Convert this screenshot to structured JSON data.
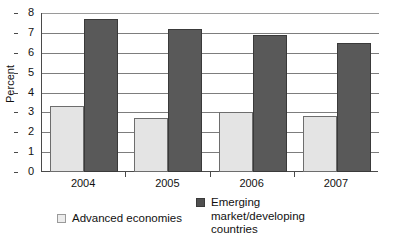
{
  "chart_data": {
    "type": "bar",
    "title": "",
    "subtitle": "",
    "xlabel": "",
    "ylabel": "Percent",
    "categories": [
      "2004",
      "2005",
      "2006",
      "2007"
    ],
    "series": [
      {
        "name": "Advanced economies",
        "legend_label": "Advanced economies",
        "color": "#e4e4e4",
        "values": [
          3.3,
          2.7,
          3.0,
          2.8
        ]
      },
      {
        "name": "Emerging market/developing countries",
        "legend_label": "Emerging\nmarket/developing\ncountries",
        "color": "#595959",
        "values": [
          7.7,
          7.2,
          6.9,
          6.5
        ]
      }
    ],
    "ylim": [
      0,
      8
    ],
    "y_ticks": [
      "0",
      "1",
      "2",
      "3",
      "4",
      "5",
      "6",
      "7",
      "8"
    ],
    "grid": true,
    "grid_axis": "y",
    "legend_position": "bottom",
    "bar_grouping": "grouped"
  },
  "colors": {
    "series_light": "#e4e4e4",
    "series_light_border": "#6d6d6d",
    "series_dark": "#595959",
    "series_dark_border": "#3a3a3a",
    "axis": "#4a4a4a",
    "gridline": "#7d7d7d",
    "text": "#111111",
    "background": "#ffffff"
  }
}
